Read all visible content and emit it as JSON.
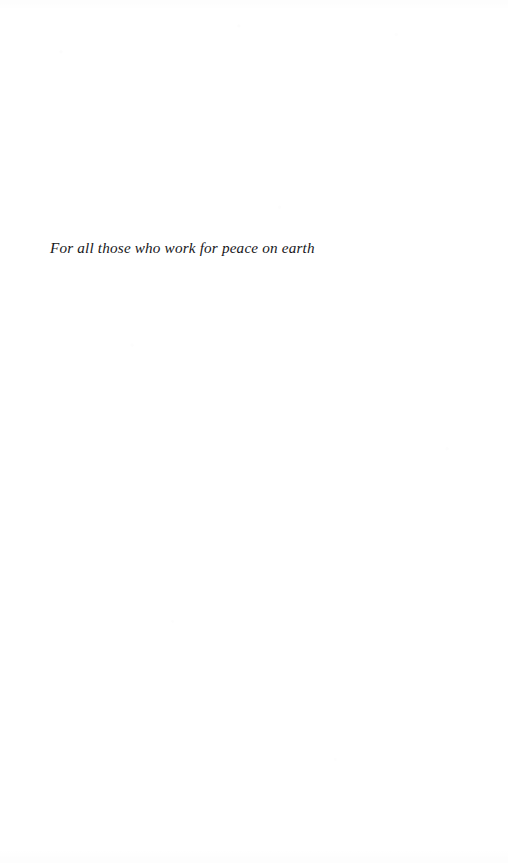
{
  "page": {
    "kind": "book-dedication-page",
    "background_color": "#ffffff",
    "ink_color": "#17171a",
    "width": 508,
    "height": 863
  },
  "dedication": {
    "text": "For all those who work for peace on earth"
  }
}
